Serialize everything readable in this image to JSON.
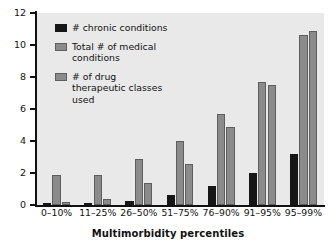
{
  "chart_data": {
    "type": "bar",
    "title": "",
    "subtitle": "",
    "xlabel": "Multimorbidity percentiles",
    "ylabel": "",
    "ylim": [
      0,
      12
    ],
    "yticks": [
      0,
      2,
      4,
      6,
      8,
      10,
      12
    ],
    "grid": false,
    "legend_position": "inside-top-left",
    "categories": [
      "0–10%",
      "11–25%",
      "26–50%",
      "51–75%",
      "76–90%",
      "91–95%",
      "95–99%"
    ],
    "series": [
      {
        "name": "# chronic conditions",
        "color": "#161616",
        "values": [
          0.1,
          0.1,
          0.22,
          0.65,
          1.2,
          2.0,
          3.2
        ]
      },
      {
        "name": "Total # of medical conditions",
        "color": "#8b8b8b",
        "values": [
          1.9,
          1.85,
          2.85,
          4.0,
          5.7,
          7.7,
          10.6
        ]
      },
      {
        "name": "# of drug therapeutic classes used",
        "color": "#8b8b8b",
        "values": [
          0.2,
          0.4,
          1.35,
          2.55,
          4.9,
          7.5,
          10.9
        ]
      }
    ],
    "legend_labels": [
      "# chronic conditions",
      "Total # of medical conditions",
      "# of drug therapeutic classes used"
    ]
  },
  "style": {
    "plot_background": "#e9e9e9",
    "page_background": "#ffffff",
    "axis_color": "#111111",
    "series_colors": [
      "#161616",
      "#8b8b8b",
      "#8b8b8b"
    ]
  }
}
